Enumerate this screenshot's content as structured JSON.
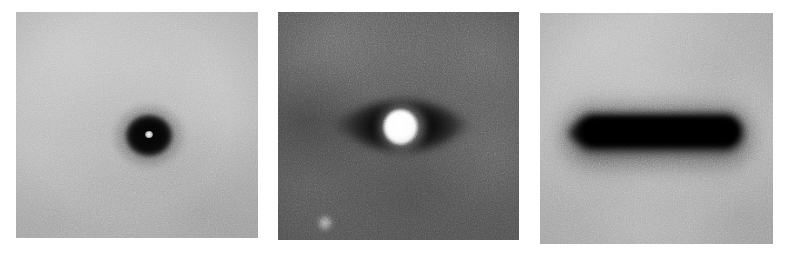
{
  "figure": {
    "background_color": "#ffffff",
    "width": 787,
    "height": 262,
    "panel_count": 3,
    "caption": ""
  },
  "panels": [
    {
      "id": "panel-1",
      "label": "",
      "position": "left",
      "rect": {
        "x": 16,
        "y": 12,
        "width": 242,
        "height": 226
      },
      "background_color": "#b9b9b9",
      "background_description": "light gray grainy field with soft mottling, slightly darker toward lower right",
      "features": [
        {
          "name": "dark-ring-blob",
          "description": "compact dark roughly circular blob with soft halo",
          "center": {
            "x": 133,
            "y": 123
          },
          "size": {
            "width": 46,
            "height": 41
          },
          "color": "#050505"
        },
        {
          "name": "bright-center-dot",
          "description": "tiny bright point at the center of the dark blob",
          "center": {
            "x": 133,
            "y": 122
          },
          "size": {
            "width": 8,
            "height": 7
          },
          "color": "#f2f2f2"
        }
      ]
    },
    {
      "id": "panel-2",
      "label": "",
      "position": "center",
      "rect": {
        "x": 278,
        "y": 12,
        "width": 241,
        "height": 228
      },
      "background_color": "#565656",
      "background_description": "dark gray grainy field, darker patch at mid-left, brighter band across the top",
      "features": [
        {
          "name": "dark-lobe",
          "description": "horizontally elongated dark lobe flanking the bright core",
          "center": {
            "x": 124,
            "y": 113
          },
          "size": {
            "width": 132,
            "height": 52
          },
          "color": "#060606"
        },
        {
          "name": "bright-core",
          "description": "saturated white circular core at the center of the dark lobe",
          "center": {
            "x": 122,
            "y": 115
          },
          "size": {
            "width": 33,
            "height": 34
          },
          "color": "#ffffff"
        },
        {
          "name": "faint-dot",
          "description": "small faint bright dot in the lower-left quadrant",
          "center": {
            "x": 47,
            "y": 211
          },
          "size": {
            "width": 16,
            "height": 16
          },
          "color": "#e1e1e1"
        }
      ]
    },
    {
      "id": "panel-3",
      "label": "",
      "position": "right",
      "rect": {
        "x": 540,
        "y": 13,
        "width": 233,
        "height": 231
      },
      "background_color": "#b6b6b6",
      "background_description": "light gray grainy field with soft mottling, darker toward the lower corners",
      "features": [
        {
          "name": "horizontal-dark-bar",
          "description": "wide, blurred, rounded horizontal black bar spanning most of the panel width",
          "center": {
            "x": 119,
            "y": 119
          },
          "size": {
            "width": 168,
            "height": 36
          },
          "color": "#000000"
        }
      ]
    }
  ]
}
